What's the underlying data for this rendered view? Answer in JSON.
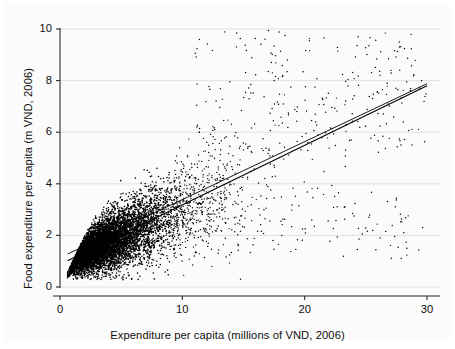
{
  "chart_data": {
    "type": "scatter",
    "title": "",
    "subtitle": "",
    "xlabel": "Expenditure per capita (millions of VND, 2006)",
    "ylabel": "Food expenditure per capita (m VND, 2006)",
    "xlim": [
      0,
      30
    ],
    "ylim": [
      0,
      10
    ],
    "xticks": [
      0,
      10,
      20,
      30
    ],
    "yticks": [
      0,
      2,
      4,
      6,
      8,
      10
    ],
    "xtick_labels": [
      "0",
      "10",
      "20",
      "30"
    ],
    "ytick_labels": [
      "0",
      "2",
      "4",
      "6",
      "8",
      "10"
    ],
    "grid": "horizontal",
    "grid_color": "#d9d9d9",
    "legend": "none",
    "marker": {
      "shape": "circle",
      "color": "#000000",
      "size": 1.4
    },
    "n_points": 7400,
    "point_cloud_description": "Dense wedge-shaped cloud of household observations rising from near the origin; extremely dense for x between 1 and 8 where food expenditure runs 0.5-4, fanning out and thinning toward x=30 with scatter between 1 and 10.",
    "scatter_model": {
      "x_min": 0.6,
      "x_max": 30.0,
      "x_shape": "right-skewed, mode near 4",
      "mean_slope": 0.233,
      "mean_intercept": 0.85,
      "spread_base": 0.22,
      "spread_growth": 0.085
    },
    "series": [
      {
        "name": "Households",
        "type": "scatter",
        "color": "#000000",
        "approx_points": [
          [
            0.8,
            0.55
          ],
          [
            1.0,
            0.7
          ],
          [
            1.2,
            0.85
          ],
          [
            1.5,
            0.95
          ],
          [
            2.0,
            1.2
          ],
          [
            2.5,
            1.35
          ],
          [
            3.0,
            1.55
          ],
          [
            3.5,
            1.7
          ],
          [
            4.0,
            1.9
          ],
          [
            4.5,
            2.0
          ],
          [
            5.0,
            2.15
          ],
          [
            6.0,
            2.4
          ],
          [
            7.0,
            2.6
          ],
          [
            8.0,
            2.8
          ],
          [
            9.0,
            3.0
          ],
          [
            10.0,
            3.2
          ],
          [
            12.0,
            3.6
          ],
          [
            14.0,
            4.1
          ],
          [
            16.0,
            4.5
          ],
          [
            18.0,
            5.0
          ],
          [
            20.0,
            5.4
          ],
          [
            22.0,
            5.9
          ],
          [
            24.0,
            6.4
          ],
          [
            26.0,
            6.9
          ],
          [
            28.0,
            7.4
          ],
          [
            30.0,
            7.85
          ]
        ]
      }
    ],
    "fit_lines": [
      {
        "name": "fit-line-upper",
        "color": "#000000",
        "width": 0.9,
        "x0": 0.62,
        "y0": 1.28,
        "x1": 30.0,
        "y1": 7.88
      },
      {
        "name": "fit-line-lower",
        "color": "#000000",
        "width": 1.1,
        "x0": 0.62,
        "y0": 1.02,
        "x1": 30.0,
        "y1": 7.8
      }
    ],
    "axis_color": "#2b2b2b",
    "background": "#ffffff",
    "plot_region_background": "#fbfbfb"
  },
  "axes": {
    "x_title": "Expenditure per capita (millions of VND, 2006)",
    "y_title": "Food expenditure per capita (m VND, 2006)"
  }
}
